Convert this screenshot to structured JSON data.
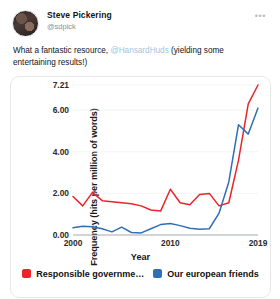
{
  "tweet": {
    "display_name": "Steve Pickering",
    "handle": "@sdpick",
    "more_icon": "•••",
    "text_before": "What a fantastic resource, ",
    "mention": "@HansardHuds",
    "text_after": " (yielding some entertaining results!)"
  },
  "colors": {
    "red": "#e8262a",
    "blue": "#2f6fb5",
    "grid": "#eceff1",
    "axis": "#9aa0a6"
  },
  "chart_data": {
    "type": "line",
    "title": "",
    "xlabel": "Year",
    "ylabel": "Frequency (hits per million of words)",
    "x": [
      2000,
      2001,
      2002,
      2003,
      2004,
      2005,
      2006,
      2007,
      2008,
      2009,
      2010,
      2011,
      2012,
      2013,
      2014,
      2015,
      2016,
      2017,
      2018,
      2019
    ],
    "xticks": [
      2000,
      2010,
      2019
    ],
    "yticks": [
      0.0,
      2.0,
      4.0,
      6.0,
      7.21
    ],
    "ytick_labels": [
      "0.00",
      "2.00",
      "4.00",
      "6.00",
      "7.21"
    ],
    "xlim": [
      2000,
      2019
    ],
    "ylim": [
      0,
      7.21
    ],
    "grid": true,
    "legend_position": "bottom",
    "series": [
      {
        "name": "Responsible governme…",
        "full_name": "Responsible government",
        "color": "#e8262a",
        "values": [
          1.85,
          1.4,
          2.05,
          1.65,
          1.6,
          1.55,
          1.5,
          1.4,
          1.2,
          1.15,
          2.2,
          1.55,
          1.45,
          1.95,
          2.0,
          1.4,
          1.55,
          3.6,
          6.3,
          7.21
        ]
      },
      {
        "name": "Our european friends",
        "color": "#2f6fb5",
        "values": [
          0.35,
          0.42,
          0.4,
          0.3,
          0.15,
          0.38,
          0.12,
          0.1,
          0.3,
          0.5,
          0.55,
          0.45,
          0.32,
          0.28,
          0.3,
          1.05,
          2.55,
          5.3,
          4.85,
          6.1
        ]
      }
    ]
  }
}
